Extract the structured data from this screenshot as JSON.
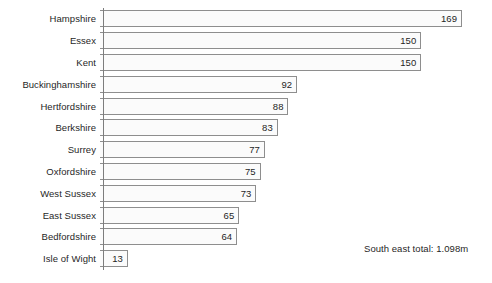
{
  "chart_data": {
    "type": "bar",
    "orientation": "horizontal",
    "title": "",
    "subtitle": "",
    "xlabel": "",
    "ylabel": "",
    "grid": false,
    "legend": null,
    "xlim": [
      0,
      169
    ],
    "categories": [
      "Hampshire",
      "Essex",
      "Kent",
      "Buckinghamshire",
      "Hertfordshire",
      "Berkshire",
      "Surrey",
      "Oxfordshire",
      "West Sussex",
      "East Sussex",
      "Bedfordshire",
      "Isle of Wight"
    ],
    "values": [
      169,
      150,
      150,
      92,
      88,
      83,
      77,
      75,
      73,
      65,
      64,
      13
    ],
    "bars": [
      {
        "label": "Hampshire",
        "value": 169,
        "value_label": "169"
      },
      {
        "label": "Essex",
        "value": 150,
        "value_label": "150"
      },
      {
        "label": "Kent",
        "value": 150,
        "value_label": "150"
      },
      {
        "label": "Buckinghamshire",
        "value": 92,
        "value_label": "92"
      },
      {
        "label": "Hertfordshire",
        "value": 88,
        "value_label": "88"
      },
      {
        "label": "Berkshire",
        "value": 83,
        "value_label": "83"
      },
      {
        "label": "Surrey",
        "value": 77,
        "value_label": "77"
      },
      {
        "label": "Oxfordshire",
        "value": 75,
        "value_label": "75"
      },
      {
        "label": "West Sussex",
        "value": 73,
        "value_label": "73"
      },
      {
        "label": "East Sussex",
        "value": 65,
        "value_label": "65"
      },
      {
        "label": "Bedfordshire",
        "value": 64,
        "value_label": "64"
      },
      {
        "label": "Isle of Wight",
        "value": 13,
        "value_label": "13"
      }
    ],
    "annotations": [
      {
        "text": "South east total: 1.098m"
      }
    ],
    "colors": {
      "bar_fill": "#fbfbfb",
      "bar_border": "#8e8e8e",
      "axis": "#7d7d7d",
      "text": "#1f1f1f",
      "background": "#ffffff"
    }
  },
  "annotation": {
    "total_text": "South east total: 1.098m"
  }
}
